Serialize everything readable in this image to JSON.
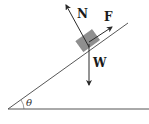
{
  "diagram": {
    "labels": {
      "normal_force": "N",
      "applied_force": "F",
      "weight": "W",
      "angle": "θ"
    },
    "colors": {
      "line": "#2a2a2a",
      "block": "#8f8f8f",
      "background": "#ffffff"
    }
  }
}
